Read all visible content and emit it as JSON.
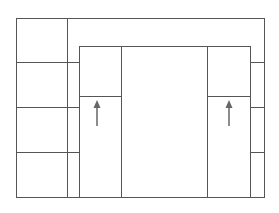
{
  "diagram": {
    "colors": {
      "background": "#ffffff",
      "line": "#555555",
      "arrow": "#666666"
    },
    "outer_box": {
      "x1": 16,
      "y1": 18,
      "x2": 264,
      "y2": 197
    },
    "left_strip_divider_x": 67,
    "inner_box": {
      "x1": 79,
      "y1": 46,
      "x2": 250,
      "y2": 197
    },
    "inner_dividers_x": [
      121,
      207
    ],
    "inner_split_y": 96,
    "side_rows_y": [
      62,
      107,
      152
    ],
    "arrows": [
      {
        "name": "left-arrow",
        "x": 97,
        "y_tail": 126,
        "y_tip": 101,
        "direction": "up"
      },
      {
        "name": "right-arrow",
        "x": 229,
        "y_tail": 126,
        "y_tip": 101,
        "direction": "up"
      }
    ]
  }
}
